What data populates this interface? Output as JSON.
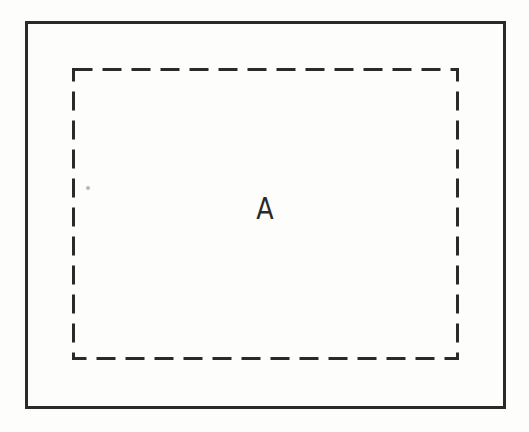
{
  "diagram": {
    "outer_region": {
      "style": "solid",
      "color": "#2a2a2a"
    },
    "inner_region": {
      "style": "dashed",
      "color": "#2a2a2a",
      "label": "A"
    }
  }
}
